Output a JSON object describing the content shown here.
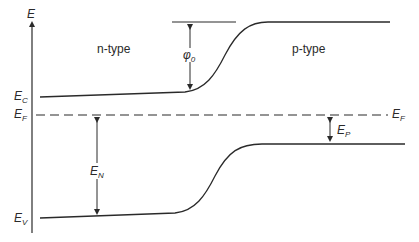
{
  "diagram": {
    "axis_label": "E",
    "regions": {
      "left": "n-type",
      "right": "p-type"
    },
    "levels": {
      "conduction": {
        "main": "E",
        "sub": "C"
      },
      "fermi_left": {
        "main": "E",
        "sub": "F"
      },
      "fermi_right": {
        "main": "E",
        "sub": "F"
      },
      "valence": {
        "main": "E",
        "sub": "V"
      }
    },
    "annotations": {
      "barrier": {
        "main": "φ",
        "sub": "0"
      },
      "en": {
        "main": "E",
        "sub": "N"
      },
      "ep": {
        "main": "E",
        "sub": "P"
      }
    },
    "colors": {
      "line": "#2a2a2a",
      "background": "#ffffff"
    }
  }
}
